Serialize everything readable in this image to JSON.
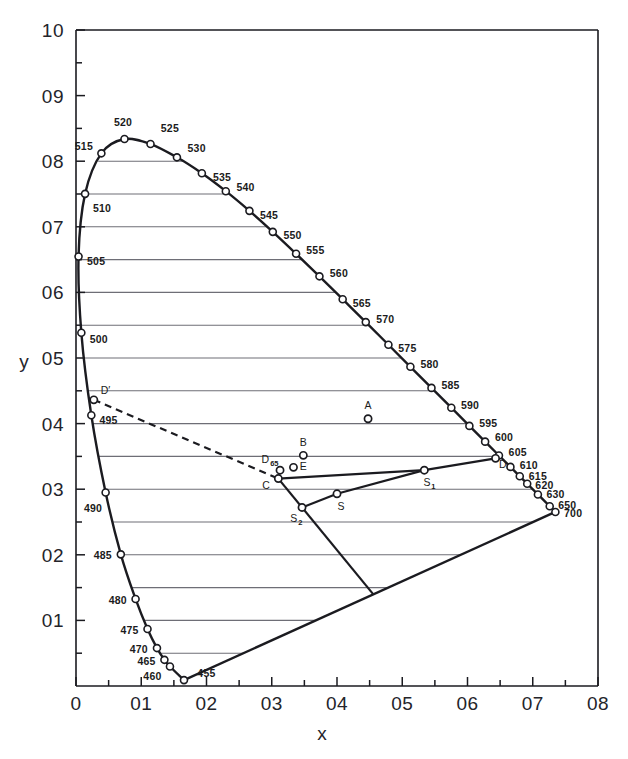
{
  "figure": {
    "background_color": "#ffffff",
    "ink_color": "#1b1b20",
    "grid_color": "#6e6e76"
  },
  "chart_data": {
    "type": "scatter",
    "title": "",
    "xlabel": "x",
    "ylabel": "y",
    "xlim": [
      0,
      0.8
    ],
    "ylim": [
      0,
      1.0
    ],
    "grid": true,
    "legend": "none",
    "x_ticks": [
      {
        "value": 0,
        "label": "0"
      },
      {
        "value": 0.1,
        "label": "01"
      },
      {
        "value": 0.2,
        "label": "02"
      },
      {
        "value": 0.3,
        "label": "03"
      },
      {
        "value": 0.4,
        "label": "04"
      },
      {
        "value": 0.5,
        "label": "05"
      },
      {
        "value": 0.6,
        "label": "06"
      },
      {
        "value": 0.7,
        "label": "07"
      },
      {
        "value": 0.8,
        "label": "08"
      }
    ],
    "x_minor_ticks": [
      0.05,
      0.15,
      0.25,
      0.35,
      0.45,
      0.55,
      0.65,
      0.75
    ],
    "y_ticks": [
      {
        "value": 0.1,
        "label": "01"
      },
      {
        "value": 0.2,
        "label": "02"
      },
      {
        "value": 0.3,
        "label": "03"
      },
      {
        "value": 0.4,
        "label": "04"
      },
      {
        "value": 0.5,
        "label": "05"
      },
      {
        "value": 0.6,
        "label": "06"
      },
      {
        "value": 0.7,
        "label": "07"
      },
      {
        "value": 0.8,
        "label": "08"
      },
      {
        "value": 0.9,
        "label": "09"
      },
      {
        "value": 1.0,
        "label": "10"
      }
    ],
    "y_minor_ticks": [
      0.05,
      0.15,
      0.25,
      0.35,
      0.45,
      0.55,
      0.65,
      0.75,
      0.85,
      0.95
    ],
    "gridlines_y": [
      0.05,
      0.1,
      0.15,
      0.2,
      0.25,
      0.3,
      0.35,
      0.4,
      0.45,
      0.5,
      0.55,
      0.6,
      0.65,
      0.7,
      0.75,
      0.8
    ],
    "spectral_locus": {
      "name": "spectral locus",
      "label_suffix": "nm",
      "points": [
        {
          "wl": "455",
          "x": 0.1655,
          "y": 0.009,
          "lx": 0.186,
          "ly": 0.02,
          "anchor": "start"
        },
        {
          "wl": "460",
          "x": 0.144,
          "y": 0.0297,
          "lx": 0.131,
          "ly": 0.0145,
          "anchor": "end"
        },
        {
          "wl": "465",
          "x": 0.1355,
          "y": 0.0399,
          "lx": 0.122,
          "ly": 0.0385,
          "anchor": "end"
        },
        {
          "wl": "470",
          "x": 0.1241,
          "y": 0.0578,
          "lx": 0.11,
          "ly": 0.0565,
          "anchor": "end"
        },
        {
          "wl": "475",
          "x": 0.1096,
          "y": 0.0868,
          "lx": 0.096,
          "ly": 0.0855,
          "anchor": "end"
        },
        {
          "wl": "480",
          "x": 0.0913,
          "y": 0.1327,
          "lx": 0.078,
          "ly": 0.1315,
          "anchor": "end"
        },
        {
          "wl": "485",
          "x": 0.0687,
          "y": 0.2007,
          "lx": 0.055,
          "ly": 0.1995,
          "anchor": "end"
        },
        {
          "wl": "490",
          "x": 0.0454,
          "y": 0.295,
          "lx": 0.04,
          "ly": 0.272,
          "anchor": "end"
        },
        {
          "wl": "495",
          "x": 0.0235,
          "y": 0.4127,
          "lx": 0.036,
          "ly": 0.406,
          "anchor": "start"
        },
        {
          "wl": "500",
          "x": 0.0082,
          "y": 0.5384,
          "lx": 0.021,
          "ly": 0.529,
          "anchor": "start"
        },
        {
          "wl": "505",
          "x": 0.0039,
          "y": 0.6548,
          "lx": 0.017,
          "ly": 0.6485,
          "anchor": "start"
        },
        {
          "wl": "510",
          "x": 0.0139,
          "y": 0.7502,
          "lx": 0.026,
          "ly": 0.729,
          "anchor": "start"
        },
        {
          "wl": "515",
          "x": 0.0389,
          "y": 0.812,
          "lx": 0.026,
          "ly": 0.823,
          "anchor": "end"
        },
        {
          "wl": "520",
          "x": 0.0743,
          "y": 0.8338,
          "lx": 0.072,
          "ly": 0.859,
          "anchor": "middle"
        },
        {
          "wl": "525",
          "x": 0.1142,
          "y": 0.8262,
          "lx": 0.13,
          "ly": 0.851,
          "anchor": "start"
        },
        {
          "wl": "530",
          "x": 0.1547,
          "y": 0.8059,
          "lx": 0.171,
          "ly": 0.8195,
          "anchor": "start"
        },
        {
          "wl": "535",
          "x": 0.1929,
          "y": 0.7816,
          "lx": 0.21,
          "ly": 0.7755,
          "anchor": "start"
        },
        {
          "wl": "540",
          "x": 0.2296,
          "y": 0.7543,
          "lx": 0.246,
          "ly": 0.761,
          "anchor": "start"
        },
        {
          "wl": "545",
          "x": 0.2658,
          "y": 0.7243,
          "lx": 0.282,
          "ly": 0.7185,
          "anchor": "start"
        },
        {
          "wl": "550",
          "x": 0.3016,
          "y": 0.6923,
          "lx": 0.318,
          "ly": 0.687,
          "anchor": "start"
        },
        {
          "wl": "555",
          "x": 0.3373,
          "y": 0.6589,
          "lx": 0.353,
          "ly": 0.665,
          "anchor": "start"
        },
        {
          "wl": "560",
          "x": 0.3731,
          "y": 0.6245,
          "lx": 0.389,
          "ly": 0.6295,
          "anchor": "start"
        },
        {
          "wl": "565",
          "x": 0.4087,
          "y": 0.5896,
          "lx": 0.424,
          "ly": 0.5845,
          "anchor": "start"
        },
        {
          "wl": "570",
          "x": 0.4441,
          "y": 0.5547,
          "lx": 0.46,
          "ly": 0.56,
          "anchor": "start"
        },
        {
          "wl": "575",
          "x": 0.4788,
          "y": 0.5202,
          "lx": 0.494,
          "ly": 0.515,
          "anchor": "start"
        },
        {
          "wl": "580",
          "x": 0.5125,
          "y": 0.4866,
          "lx": 0.528,
          "ly": 0.4915,
          "anchor": "start"
        },
        {
          "wl": "585",
          "x": 0.5448,
          "y": 0.4544,
          "lx": 0.56,
          "ly": 0.4595,
          "anchor": "start"
        },
        {
          "wl": "590",
          "x": 0.5752,
          "y": 0.4242,
          "lx": 0.59,
          "ly": 0.429,
          "anchor": "start"
        },
        {
          "wl": "595",
          "x": 0.6029,
          "y": 0.3965,
          "lx": 0.618,
          "ly": 0.401,
          "anchor": "start"
        },
        {
          "wl": "600",
          "x": 0.627,
          "y": 0.3725,
          "lx": 0.642,
          "ly": 0.379,
          "anchor": "start"
        },
        {
          "wl": "605",
          "x": 0.6482,
          "y": 0.3514,
          "lx": 0.663,
          "ly": 0.3565,
          "anchor": "start"
        },
        {
          "wl": "610",
          "x": 0.6658,
          "y": 0.334,
          "lx": 0.68,
          "ly": 0.337,
          "anchor": "start"
        },
        {
          "wl": "615",
          "x": 0.6801,
          "y": 0.3197,
          "lx": 0.694,
          "ly": 0.3205,
          "anchor": "start"
        },
        {
          "wl": "620",
          "x": 0.6915,
          "y": 0.3083,
          "lx": 0.704,
          "ly": 0.306,
          "anchor": "start"
        },
        {
          "wl": "630",
          "x": 0.7079,
          "y": 0.292,
          "lx": 0.721,
          "ly": 0.293,
          "anchor": "start"
        },
        {
          "wl": "650",
          "x": 0.726,
          "y": 0.274,
          "lx": 0.739,
          "ly": 0.276,
          "anchor": "start"
        },
        {
          "wl": "700",
          "x": 0.7347,
          "y": 0.2653,
          "lx": 0.748,
          "ly": 0.264,
          "anchor": "start"
        }
      ]
    },
    "special_points": [
      {
        "id": "A",
        "label": "A",
        "sub": "",
        "x": 0.4476,
        "y": 0.4074,
        "lx": 0.4476,
        "ly": 0.429,
        "anchor": "middle"
      },
      {
        "id": "B",
        "label": "B",
        "sub": "",
        "x": 0.3484,
        "y": 0.3516,
        "lx": 0.3484,
        "ly": 0.3725,
        "anchor": "middle"
      },
      {
        "id": "D65",
        "label": "D",
        "sub": "65",
        "x": 0.3127,
        "y": 0.329,
        "lx": 0.296,
        "ly": 0.3455,
        "anchor": "end"
      },
      {
        "id": "E",
        "label": "E",
        "sub": "",
        "x": 0.3333,
        "y": 0.3333,
        "lx": 0.343,
        "ly": 0.336,
        "anchor": "start"
      },
      {
        "id": "C",
        "label": "C",
        "sub": "",
        "x": 0.3101,
        "y": 0.3162,
        "lx": 0.297,
        "ly": 0.306,
        "anchor": "end"
      },
      {
        "id": "D",
        "label": "D",
        "sub": "",
        "x": 0.643,
        "y": 0.347,
        "lx": 0.654,
        "ly": 0.3385,
        "anchor": "middle"
      },
      {
        "id": "S",
        "label": "S",
        "sub": "",
        "x": 0.4,
        "y": 0.293,
        "lx": 0.406,
        "ly": 0.2745,
        "anchor": "middle"
      },
      {
        "id": "S1",
        "label": "S",
        "sub": "1",
        "x": 0.5338,
        "y": 0.329,
        "lx": 0.538,
        "ly": 0.3105,
        "anchor": "middle"
      },
      {
        "id": "S2",
        "label": "S",
        "sub": "2",
        "x": 0.3464,
        "y": 0.2722,
        "lx": 0.339,
        "ly": 0.256,
        "anchor": "end"
      },
      {
        "id": "Dprime",
        "label": "D",
        "sub": "",
        "x": 0.0273,
        "y": 0.4362,
        "lx": 0.038,
        "ly": 0.4515,
        "anchor": "start",
        "prime": true
      }
    ],
    "segments": [
      {
        "name": "purple-line",
        "from": "455",
        "to": "700",
        "style": "solid"
      },
      {
        "name": "planckian-dashed",
        "from": "Dprime",
        "to": "C",
        "style": "dashed"
      },
      {
        "name": "gamut-C-S1",
        "from": "C",
        "to": "S1",
        "style": "solid"
      },
      {
        "name": "gamut-S1-D",
        "from": "S1",
        "to": "D",
        "style": "solid"
      },
      {
        "name": "gamut-C-S2",
        "from": "C",
        "to": "S2",
        "style": "solid"
      },
      {
        "name": "gamut-S2-S",
        "from": "S2",
        "to": "S",
        "style": "solid"
      },
      {
        "name": "gamut-S-S1",
        "from": "S",
        "to": "S1",
        "style": "solid"
      },
      {
        "name": "ray-C-purple",
        "from": "C",
        "to": "purple-intersect",
        "style": "solid"
      }
    ]
  }
}
